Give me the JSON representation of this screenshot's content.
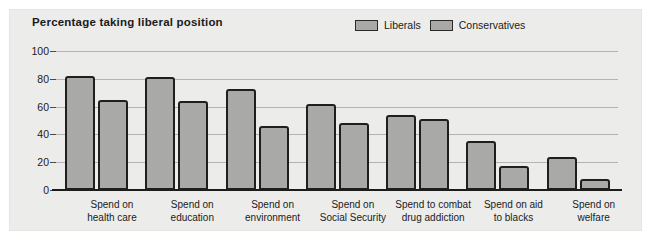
{
  "chart_data": {
    "type": "bar",
    "title": "Percentage taking liberal position",
    "xlabel": "",
    "ylabel": "",
    "ylim": [
      0,
      100
    ],
    "yticks": [
      "0",
      "20",
      "40",
      "60",
      "80",
      "100"
    ],
    "grid": true,
    "legend_position": "top-right",
    "categories": [
      "Spend on health care",
      "Spend on education",
      "Spend on environment",
      "Spend on Social Security",
      "Spend to combat drug addiction",
      "Spend on aid to blacks",
      "Spend on welfare"
    ],
    "category_lines": [
      [
        "Spend on",
        "health care"
      ],
      [
        "Spend on",
        "education"
      ],
      [
        "Spend on",
        "environment"
      ],
      [
        "Spend on",
        "Social Security"
      ],
      [
        "Spend to combat",
        "drug addiction"
      ],
      [
        "Spend on aid",
        "to blacks"
      ],
      [
        "Spend on",
        "welfare"
      ]
    ],
    "series": [
      {
        "name": "Liberals",
        "values": [
          82,
          81,
          73,
          62,
          54,
          35,
          24
        ]
      },
      {
        "name": "Conservatives",
        "values": [
          65,
          64,
          46,
          48,
          51,
          17,
          8
        ]
      }
    ],
    "colors": {
      "bar_fill": "#a9a9a7",
      "bar_stroke": "#1f1f1f",
      "panel": "#ececea",
      "gridline": "#b3b3b1",
      "text": "#1b1b1b"
    }
  },
  "legend": {
    "items": [
      {
        "label": "Liberals"
      },
      {
        "label": "Conservatives"
      }
    ]
  }
}
